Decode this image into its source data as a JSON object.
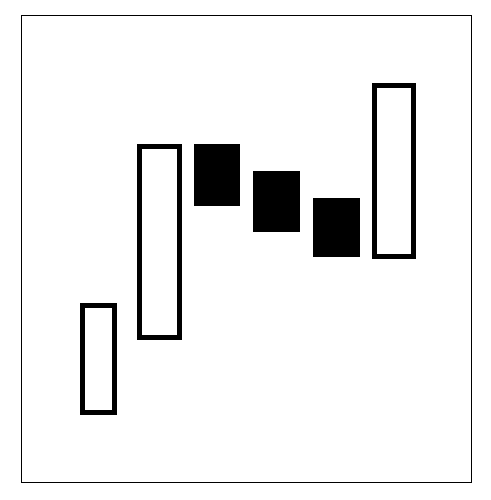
{
  "canvas": {
    "width": 491,
    "height": 500,
    "background_color": "#ffffff"
  },
  "frame": {
    "name": "plot-border",
    "x": 21,
    "y": 15,
    "width": 451,
    "height": 468,
    "stroke_color": "#000000",
    "stroke_width": 1
  },
  "style": {
    "outline_color": "#000000",
    "hollow_fill": "#ffffff",
    "filled_fill": "#000000",
    "candle_stroke_width": 5
  },
  "chart_data": {
    "type": "bar",
    "subtype": "candlestick-bodies",
    "title": "",
    "subtitle": "",
    "xlabel": "",
    "ylabel": "",
    "grid": false,
    "legend": null,
    "axes_visible": false,
    "tick_labels_x": [],
    "tick_labels_y": [],
    "categories": [
      "1",
      "2",
      "3",
      "4",
      "5",
      "6"
    ],
    "series": [
      {
        "name": "body-top-pixel",
        "values": [
          303,
          144,
          144,
          171,
          198,
          83
        ]
      },
      {
        "name": "body-bottom-pixel",
        "values": [
          415,
          340,
          206,
          232,
          257,
          259
        ]
      }
    ],
    "bodies": [
      {
        "index": 1,
        "fill": "hollow",
        "direction": "up",
        "x": 80,
        "y": 303,
        "width": 37,
        "height": 112
      },
      {
        "index": 2,
        "fill": "hollow",
        "direction": "up",
        "x": 137,
        "y": 144,
        "width": 45,
        "height": 196
      },
      {
        "index": 3,
        "fill": "filled",
        "direction": "down",
        "x": 194,
        "y": 144,
        "width": 46,
        "height": 62
      },
      {
        "index": 4,
        "fill": "filled",
        "direction": "down",
        "x": 253,
        "y": 171,
        "width": 47,
        "height": 61
      },
      {
        "index": 5,
        "fill": "filled",
        "direction": "down",
        "x": 313,
        "y": 198,
        "width": 47,
        "height": 59
      },
      {
        "index": 6,
        "fill": "hollow",
        "direction": "up",
        "x": 372,
        "y": 83,
        "width": 44,
        "height": 176
      }
    ],
    "annotations": []
  }
}
